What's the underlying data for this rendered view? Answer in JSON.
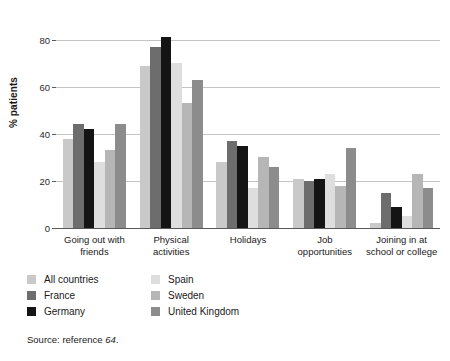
{
  "chart_data": {
    "type": "bar",
    "title": "",
    "xlabel": "",
    "ylabel": "% patients",
    "ylim": [
      0,
      85
    ],
    "yticks": [
      0,
      20,
      40,
      60,
      80
    ],
    "ytick_labels": [
      "0",
      "20",
      "40",
      "60",
      "80"
    ],
    "grid": true,
    "legend_position": "bottom-left",
    "categories": [
      "Going out with friends",
      "Physical activities",
      "Holidays",
      "Job opportunities",
      "Joining in at school or college"
    ],
    "category_lines": [
      [
        "Going out with",
        "friends"
      ],
      [
        "Physical",
        "activities"
      ],
      [
        "Holidays",
        ""
      ],
      [
        "Job",
        "opportunities"
      ],
      [
        "Joining in at",
        "school or college"
      ]
    ],
    "series": [
      {
        "name": "All countries",
        "color": "#c9c9c9",
        "values": [
          38,
          69,
          28,
          21,
          2
        ]
      },
      {
        "name": "France",
        "color": "#6d6d6d",
        "values": [
          44,
          77,
          37,
          20,
          15
        ]
      },
      {
        "name": "Germany",
        "color": "#141414",
        "values": [
          42,
          81,
          35,
          21,
          9
        ]
      },
      {
        "name": "Spain",
        "color": "#dedede",
        "values": [
          28,
          70,
          17,
          23,
          5
        ]
      },
      {
        "name": "Sweden",
        "color": "#b6b6b6",
        "values": [
          33,
          53,
          30,
          18,
          23
        ]
      },
      {
        "name": "United Kingdom",
        "color": "#8c8c8c",
        "values": [
          44,
          63,
          26,
          34,
          17
        ]
      }
    ]
  },
  "legend": {
    "items": [
      {
        "label": "All countries",
        "color": "#c9c9c9"
      },
      {
        "label": "France",
        "color": "#6d6d6d"
      },
      {
        "label": "Germany",
        "color": "#141414"
      },
      {
        "label": "Spain",
        "color": "#dedede"
      },
      {
        "label": "Sweden",
        "color": "#b6b6b6"
      },
      {
        "label": "United Kingdom",
        "color": "#8c8c8c"
      }
    ]
  },
  "source": {
    "prefix": "Source: reference ",
    "reference": "64",
    "suffix": "."
  }
}
